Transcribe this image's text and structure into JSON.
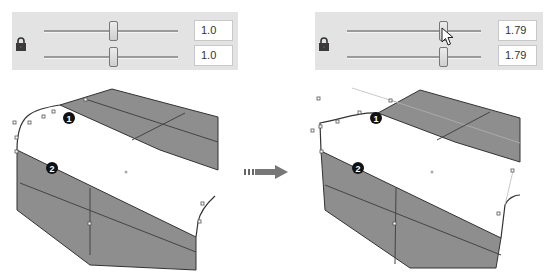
{
  "before": {
    "lock_icon": "lock-icon",
    "sliders": [
      {
        "value": "1.0",
        "thumb_pos": 75
      },
      {
        "value": "1.0",
        "thumb_pos": 75
      }
    ],
    "callouts": [
      "1",
      "2"
    ]
  },
  "transition_arrow": "arrow-right-icon",
  "after": {
    "lock_icon": "lock-icon",
    "sliders": [
      {
        "value": "1.79",
        "thumb_pos": 104
      },
      {
        "value": "1.79",
        "thumb_pos": 104
      }
    ],
    "cursor": "pointer-cursor-icon",
    "callouts": [
      "1",
      "2"
    ]
  },
  "colors": {
    "panel_bg": "#e3e3e3",
    "surface_gray": "#8c8c8c",
    "edge": "#3a3a3a",
    "callout_bg": "#111111"
  }
}
